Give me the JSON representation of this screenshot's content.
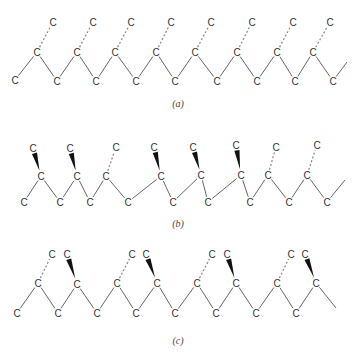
{
  "figure": {
    "atom_label": "C",
    "colors": {
      "bond": "#555555",
      "dash": "#888888",
      "wedge": "#111111",
      "text": "#333333"
    },
    "panels": [
      {
        "id": "a",
        "caption": "(a)",
        "caption_pos": [
          178,
          103
        ],
        "atoms": [
          {
            "x": 15,
            "y": 80
          },
          {
            "x": 37,
            "y": 52
          },
          {
            "x": 57,
            "y": 81
          },
          {
            "x": 77,
            "y": 52
          },
          {
            "x": 96,
            "y": 81
          },
          {
            "x": 115,
            "y": 52
          },
          {
            "x": 136,
            "y": 81
          },
          {
            "x": 156,
            "y": 52
          },
          {
            "x": 175,
            "y": 81
          },
          {
            "x": 195,
            "y": 52
          },
          {
            "x": 217,
            "y": 81
          },
          {
            "x": 237,
            "y": 52
          },
          {
            "x": 257,
            "y": 81
          },
          {
            "x": 277,
            "y": 52
          },
          {
            "x": 295,
            "y": 81
          },
          {
            "x": 313,
            "y": 52
          },
          {
            "x": 333,
            "y": 81
          },
          {
            "x": 53,
            "y": 22
          },
          {
            "x": 93,
            "y": 22
          },
          {
            "x": 131,
            "y": 22
          },
          {
            "x": 171,
            "y": 22
          },
          {
            "x": 211,
            "y": 22
          },
          {
            "x": 252,
            "y": 22
          },
          {
            "x": 293,
            "y": 22
          },
          {
            "x": 330,
            "y": 22
          }
        ],
        "bonds": [
          [
            0,
            1
          ],
          [
            1,
            2
          ],
          [
            2,
            3
          ],
          [
            3,
            4
          ],
          [
            4,
            5
          ],
          [
            5,
            6
          ],
          [
            6,
            7
          ],
          [
            7,
            8
          ],
          [
            8,
            9
          ],
          [
            9,
            10
          ],
          [
            10,
            11
          ],
          [
            11,
            12
          ],
          [
            12,
            13
          ],
          [
            13,
            14
          ],
          [
            14,
            15
          ],
          [
            15,
            16
          ]
        ],
        "tail": {
          "from": 16,
          "to": [
            347,
            62
          ]
        },
        "dashed": [
          [
            1,
            17
          ],
          [
            3,
            18
          ],
          [
            5,
            19
          ],
          [
            7,
            20
          ],
          [
            9,
            21
          ],
          [
            11,
            22
          ],
          [
            13,
            23
          ],
          [
            15,
            24
          ]
        ],
        "wedges": []
      },
      {
        "id": "b",
        "caption": "(b)",
        "caption_pos": [
          178,
          223
        ],
        "atoms": [
          {
            "x": 24,
            "y": 202
          },
          {
            "x": 41,
            "y": 176
          },
          {
            "x": 60,
            "y": 202
          },
          {
            "x": 77,
            "y": 176
          },
          {
            "x": 90,
            "y": 202
          },
          {
            "x": 106,
            "y": 176
          },
          {
            "x": 128,
            "y": 202
          },
          {
            "x": 161,
            "y": 176
          },
          {
            "x": 173,
            "y": 202
          },
          {
            "x": 201,
            "y": 175
          },
          {
            "x": 208,
            "y": 202
          },
          {
            "x": 241,
            "y": 175
          },
          {
            "x": 250,
            "y": 202
          },
          {
            "x": 268,
            "y": 175
          },
          {
            "x": 289,
            "y": 202
          },
          {
            "x": 307,
            "y": 175
          },
          {
            "x": 327,
            "y": 202
          },
          {
            "x": 33,
            "y": 148
          },
          {
            "x": 70,
            "y": 148
          },
          {
            "x": 116,
            "y": 147
          },
          {
            "x": 154,
            "y": 147
          },
          {
            "x": 193,
            "y": 147
          },
          {
            "x": 236,
            "y": 145
          },
          {
            "x": 276,
            "y": 147
          },
          {
            "x": 317,
            "y": 145
          }
        ],
        "bonds": [
          [
            0,
            1
          ],
          [
            1,
            2
          ],
          [
            2,
            3
          ],
          [
            3,
            4
          ],
          [
            4,
            5
          ],
          [
            5,
            6
          ],
          [
            6,
            7
          ],
          [
            7,
            8
          ],
          [
            8,
            9
          ],
          [
            9,
            10
          ],
          [
            10,
            11
          ],
          [
            11,
            12
          ],
          [
            12,
            13
          ],
          [
            13,
            14
          ],
          [
            14,
            15
          ],
          [
            15,
            16
          ]
        ],
        "tail": {
          "from": 16,
          "to": [
            345,
            180
          ]
        },
        "dashed": [
          [
            5,
            19
          ],
          [
            13,
            23
          ],
          [
            15,
            24
          ]
        ],
        "wedges": [
          [
            1,
            17
          ],
          [
            3,
            18
          ],
          [
            7,
            20
          ],
          [
            9,
            21
          ],
          [
            11,
            22
          ]
        ]
      },
      {
        "id": "c",
        "caption": "(c)",
        "caption_pos": [
          178,
          340
        ],
        "atoms": [
          {
            "x": 17,
            "y": 313
          },
          {
            "x": 38,
            "y": 283
          },
          {
            "x": 58,
            "y": 313
          },
          {
            "x": 77,
            "y": 284
          },
          {
            "x": 97,
            "y": 313
          },
          {
            "x": 117,
            "y": 283
          },
          {
            "x": 136,
            "y": 313
          },
          {
            "x": 157,
            "y": 283
          },
          {
            "x": 175,
            "y": 313
          },
          {
            "x": 197,
            "y": 283
          },
          {
            "x": 216,
            "y": 313
          },
          {
            "x": 236,
            "y": 283
          },
          {
            "x": 256,
            "y": 313
          },
          {
            "x": 277,
            "y": 283
          },
          {
            "x": 296,
            "y": 313
          },
          {
            "x": 316,
            "y": 283
          },
          {
            "x": 52,
            "y": 254
          },
          {
            "x": 67,
            "y": 254
          },
          {
            "x": 132,
            "y": 254
          },
          {
            "x": 146,
            "y": 254
          },
          {
            "x": 212,
            "y": 254
          },
          {
            "x": 227,
            "y": 254
          },
          {
            "x": 291,
            "y": 254
          },
          {
            "x": 305,
            "y": 254
          }
        ],
        "bonds": [
          [
            0,
            1
          ],
          [
            1,
            2
          ],
          [
            2,
            3
          ],
          [
            3,
            4
          ],
          [
            4,
            5
          ],
          [
            5,
            6
          ],
          [
            6,
            7
          ],
          [
            7,
            8
          ],
          [
            8,
            9
          ],
          [
            9,
            10
          ],
          [
            10,
            11
          ],
          [
            11,
            12
          ],
          [
            12,
            13
          ],
          [
            13,
            14
          ],
          [
            14,
            15
          ]
        ],
        "tail": {
          "from": 15,
          "to": [
            336,
            308
          ]
        },
        "extra_tail": {
          "from": 14,
          "to": [
            314,
            290
          ]
        },
        "dashed": [
          [
            1,
            16
          ],
          [
            5,
            18
          ],
          [
            9,
            20
          ],
          [
            13,
            22
          ]
        ],
        "wedges": [
          [
            3,
            17
          ],
          [
            7,
            19
          ],
          [
            11,
            21
          ],
          [
            15,
            23
          ]
        ]
      }
    ]
  }
}
